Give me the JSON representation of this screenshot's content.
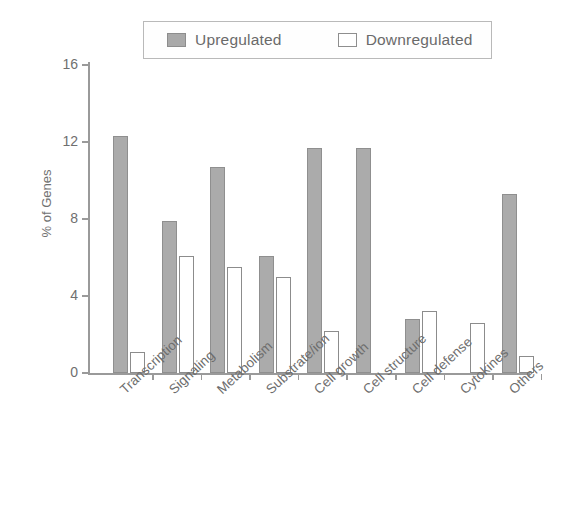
{
  "chart_data": {
    "type": "bar",
    "title": "",
    "xlabel": "",
    "ylabel": "% of Genes",
    "ylim": [
      0,
      17
    ],
    "yticks": [
      0,
      4,
      8,
      12,
      16
    ],
    "ytick_labels": [
      "0",
      "4",
      "8",
      "12",
      "16"
    ],
    "grid": false,
    "legend_position": "top-center",
    "categories": [
      "Transcription",
      "Signaling",
      "Metabolism",
      "Substrate/ion",
      "Cell growth",
      "Cell structure",
      "Cell defense",
      "Cytokines",
      "Others"
    ],
    "series": [
      {
        "name": "Upregulated",
        "color": "#ababab",
        "values": [
          12.3,
          7.9,
          10.7,
          6.1,
          11.7,
          11.7,
          2.8,
          0,
          9.3
        ]
      },
      {
        "name": "Downregulated",
        "color": "#ffffff",
        "values": [
          1.1,
          6.1,
          5.5,
          5.0,
          2.2,
          0,
          3.2,
          2.6,
          0.9
        ]
      }
    ]
  },
  "legend": {
    "entries": [
      {
        "label": "Upregulated",
        "swatch": "filled-gray-square-icon"
      },
      {
        "label": "Downregulated",
        "swatch": "hollow-white-square-icon"
      }
    ]
  },
  "axes": {
    "y_title": "% of Genes",
    "y_tick_labels": [
      "16",
      "12",
      "8",
      "4",
      "0"
    ]
  },
  "colors": {
    "upregulated_fill": "#ababab",
    "upregulated_stroke": "#8f8f8f",
    "downregulated_fill": "#ffffff",
    "downregulated_stroke": "#8c8c8c",
    "axis": "#9a9a9a",
    "text": "#6d6d6d",
    "background": "#ffffff"
  }
}
